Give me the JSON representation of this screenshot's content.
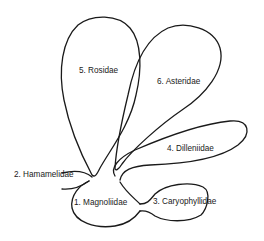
{
  "diagram": {
    "type": "phylogenetic bubble diagram",
    "colors": {
      "line": "#1a1a1a",
      "background": "#ffffff"
    },
    "groups": [
      {
        "number": "1",
        "name": "Magnoliidae",
        "label": "1. Magnoliidae"
      },
      {
        "number": "2",
        "name": "Hamamelidae",
        "label": "2. Hamamelidae"
      },
      {
        "number": "3",
        "name": "Caryophyllidae",
        "label": "3. Caryophyllidae"
      },
      {
        "number": "4",
        "name": "Dilleniidae",
        "label": "4. Dilleniidae"
      },
      {
        "number": "5",
        "name": "Rosidae",
        "label": "5. Rosidae"
      },
      {
        "number": "6",
        "name": "Asteridae",
        "label": "6. Asteridae"
      }
    ]
  }
}
